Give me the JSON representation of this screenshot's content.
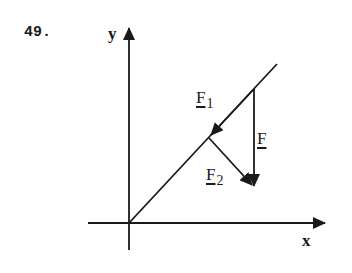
{
  "problem": {
    "number": "49."
  },
  "axes": {
    "x_label": "x",
    "y_label": "y"
  },
  "vectors": {
    "resultant": {
      "label": "F",
      "subscript": ""
    },
    "component_1": {
      "label": "F",
      "subscript": "1"
    },
    "component_2": {
      "label": "F",
      "subscript": "2"
    }
  },
  "colors": {
    "ink": "#1a1a1a",
    "background": "#ffffff"
  }
}
